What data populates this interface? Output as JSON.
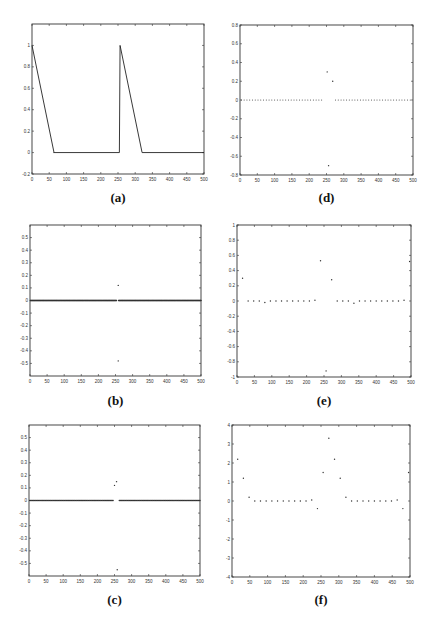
{
  "chart_data": [
    {
      "id": "a",
      "panel_label": "(a)",
      "type": "line",
      "title": "",
      "xlabel": "",
      "ylabel": "",
      "xlim": [
        0,
        500
      ],
      "ylim": [
        -0.2,
        1.2
      ],
      "xticks": [
        0,
        50,
        100,
        150,
        200,
        250,
        300,
        350,
        400,
        450,
        500
      ],
      "yticks": [
        -0.2,
        0,
        0.2,
        0.4,
        0.6,
        0.8,
        1
      ],
      "ytick_labels": [
        "-0.2",
        "0",
        "0.2",
        "0.4",
        "0.6",
        "0.8",
        "1"
      ],
      "series": [
        {
          "name": "signal",
          "x": [
            0,
            64,
            63,
            254,
            256,
            320,
            500
          ],
          "y": [
            1,
            0,
            0,
            0,
            1,
            0,
            0
          ]
        }
      ]
    },
    {
      "id": "d",
      "panel_label": "(d)",
      "type": "scatter",
      "xlim": [
        0,
        500
      ],
      "ylim": [
        -0.8,
        0.8
      ],
      "xticks": [
        0,
        50,
        100,
        150,
        200,
        250,
        300,
        350,
        400,
        450,
        500
      ],
      "yticks": [
        -0.8,
        -0.6,
        -0.4,
        -0.2,
        0,
        0.2,
        0.4,
        0.6,
        0.8
      ],
      "ytick_labels": [
        "-0.8",
        "-0.6",
        "-0.4",
        "-0.2",
        "0",
        "0.2",
        "0.4",
        "0.6",
        "0.8"
      ],
      "dense_zero": {
        "from": 4,
        "to": 496,
        "step": 8,
        "gaps": [
          [
            244,
            270
          ]
        ],
        "value": 0,
        "near_zero_offsets": {
          "72": -0.01,
          "328": -0.01
        }
      },
      "series": [
        {
          "name": "outliers",
          "x": [
            252,
            268,
            256
          ],
          "y": [
            0.3,
            0.2,
            -0.7
          ]
        }
      ]
    },
    {
      "id": "b",
      "panel_label": "(b)",
      "type": "scatter",
      "xlim": [
        0,
        500
      ],
      "ylim": [
        -0.6,
        0.6
      ],
      "xticks": [
        0,
        50,
        100,
        150,
        200,
        250,
        300,
        350,
        400,
        450,
        500
      ],
      "yticks": [
        -0.5,
        -0.4,
        -0.3,
        -0.2,
        -0.1,
        0,
        0.1,
        0.2,
        0.3,
        0.4,
        0.5
      ],
      "ytick_labels": [
        "-0.5",
        "-0.4",
        "-0.3",
        "-0.2",
        "-0.1",
        "0",
        "0.1",
        "0.2",
        "0.3",
        "0.4",
        "0.5"
      ],
      "dense_zero": {
        "from": 1,
        "to": 500,
        "step": 1,
        "gaps": [
          [
            254,
            258
          ]
        ],
        "value": 0
      },
      "series": [
        {
          "name": "outliers",
          "x": [
            258,
            258
          ],
          "y": [
            0.12,
            -0.48
          ]
        }
      ]
    },
    {
      "id": "e",
      "panel_label": "(e)",
      "type": "scatter",
      "xlim": [
        0,
        500
      ],
      "ylim": [
        -1,
        1
      ],
      "xticks": [
        0,
        50,
        100,
        150,
        200,
        250,
        300,
        350,
        400,
        450,
        500
      ],
      "yticks": [
        -1,
        -0.8,
        -0.6,
        -0.4,
        -0.2,
        0,
        0.2,
        0.4,
        0.6,
        0.8,
        1
      ],
      "ytick_labels": [
        "-1",
        "-0.8",
        "-0.6",
        "-0.4",
        "-0.2",
        "0",
        "0.2",
        "0.4",
        "0.6",
        "0.8",
        "1"
      ],
      "series": [
        {
          "name": "coefficients",
          "x": [
            16,
            32,
            48,
            64,
            80,
            96,
            112,
            128,
            144,
            160,
            176,
            192,
            208,
            224,
            240,
            256,
            272,
            288,
            304,
            320,
            336,
            352,
            368,
            384,
            400,
            416,
            432,
            448,
            464,
            480,
            496
          ],
          "y": [
            0.3,
            0,
            0,
            0,
            -0.02,
            0,
            0,
            0,
            0,
            0,
            0,
            0,
            0,
            0.01,
            0.53,
            -0.92,
            0.28,
            0,
            0,
            0,
            -0.03,
            0,
            0,
            0,
            0,
            0,
            0,
            0,
            0,
            0.01,
            0.52
          ]
        }
      ]
    },
    {
      "id": "c",
      "panel_label": "(c)",
      "type": "scatter",
      "xlim": [
        0,
        500
      ],
      "ylim": [
        -0.6,
        0.6
      ],
      "xticks": [
        0,
        50,
        100,
        150,
        200,
        250,
        300,
        350,
        400,
        450,
        500
      ],
      "yticks": [
        -0.5,
        -0.4,
        -0.3,
        -0.2,
        -0.1,
        0,
        0.1,
        0.2,
        0.3,
        0.4,
        0.5
      ],
      "ytick_labels": [
        "-0.5",
        "-0.4",
        "-0.3",
        "-0.2",
        "-0.1",
        "0",
        "0.1",
        "0.2",
        "0.3",
        "0.4",
        "0.5"
      ],
      "dense_zero": {
        "from": 2,
        "to": 500,
        "step": 2,
        "gaps": [
          [
            248,
            262
          ]
        ],
        "value": 0
      },
      "series": [
        {
          "name": "outliers",
          "x": [
            250,
            256,
            258
          ],
          "y": [
            0.12,
            0.15,
            -0.55
          ]
        }
      ]
    },
    {
      "id": "f",
      "panel_label": "(f)",
      "type": "scatter",
      "xlim": [
        0,
        500
      ],
      "ylim": [
        -4,
        4
      ],
      "xticks": [
        0,
        50,
        100,
        150,
        200,
        250,
        300,
        350,
        400,
        450,
        500
      ],
      "yticks": [
        -4,
        -3,
        -2,
        -1,
        0,
        1,
        2,
        3,
        4
      ],
      "ytick_labels": [
        "-4",
        "-3",
        "-2",
        "-1",
        "0",
        "1",
        "2",
        "3",
        "4"
      ],
      "series": [
        {
          "name": "coefficients",
          "x": [
            16,
            32,
            48,
            64,
            80,
            96,
            112,
            128,
            144,
            160,
            176,
            192,
            208,
            224,
            240,
            256,
            272,
            288,
            304,
            320,
            336,
            352,
            368,
            384,
            400,
            416,
            432,
            448,
            464,
            480,
            496
          ],
          "y": [
            2.2,
            1.2,
            0.2,
            0,
            0,
            0,
            0,
            0,
            0,
            0,
            0,
            0,
            0,
            0.05,
            -0.4,
            1.5,
            3.3,
            2.2,
            1.2,
            0.2,
            0,
            0,
            0,
            0,
            0,
            0,
            0,
            0,
            0.05,
            -0.4,
            1.5
          ]
        }
      ]
    }
  ]
}
